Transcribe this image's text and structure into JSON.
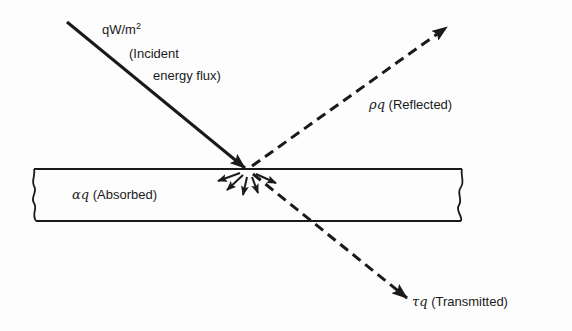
{
  "diagram": {
    "title": "",
    "colors": {
      "ink": "#1a1a1a",
      "background": "#fdfdfd"
    },
    "slab": {
      "label_symbol": "αq",
      "label_text": "(Absorbed)"
    },
    "incident": {
      "quantity": "qW/m",
      "exponent": "2",
      "line1": "(Incident",
      "line2": "energy flux)"
    },
    "reflected": {
      "symbol": "ρq",
      "text": "(Reflected)"
    },
    "transmitted": {
      "symbol": "τq",
      "text": "(Transmitted)"
    }
  }
}
